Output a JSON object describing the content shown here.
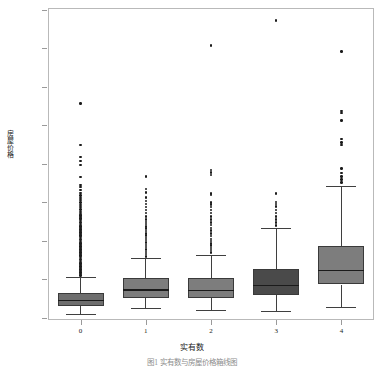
{
  "chart_data": {
    "type": "box",
    "title": "",
    "xlabel": "实有数",
    "ylabel": "房屋价格",
    "caption": "图1 实有数与房屋价格箱线图",
    "categories": [
      "0",
      "1",
      "2",
      "3",
      "4"
    ],
    "ylim": [
      0,
      8000000
    ],
    "ytick_labels": [
      "0",
      "1000000",
      "2000000",
      "3000000",
      "4000000",
      "5000000",
      "6000000",
      "7000000",
      "8000000"
    ],
    "ytick_values": [
      0,
      1000000,
      2000000,
      3000000,
      4000000,
      5000000,
      6000000,
      7000000,
      8000000
    ],
    "grid": false,
    "legend": "none",
    "box_fill_color": "#7f7f7f",
    "box_edge_color": "#3a3a3a",
    "median_color": "#1b1b1b",
    "flier_color": "#1c1c1c",
    "boxes": [
      {
        "category": "0",
        "q1": 300000,
        "median": 450000,
        "q3": 640000,
        "whisker_low": 100000,
        "whisker_high": 1060000,
        "fill": "#6e6e6e",
        "fliers": [
          1100000,
          1140000,
          1180000,
          1220000,
          1260000,
          1300000,
          1340000,
          1380000,
          1420000,
          1460000,
          1500000,
          1540000,
          1580000,
          1620000,
          1660000,
          1700000,
          1740000,
          1780000,
          1820000,
          1860000,
          1900000,
          1940000,
          1980000,
          2020000,
          2060000,
          2100000,
          2140000,
          2180000,
          2220000,
          2260000,
          2300000,
          2340000,
          2380000,
          2420000,
          2460000,
          2500000,
          2540000,
          2580000,
          2620000,
          2660000,
          2700000,
          2760000,
          2820000,
          2880000,
          2940000,
          3000000,
          3060000,
          3120000,
          3180000,
          3250000,
          3320000,
          3400000,
          3450000,
          3660000,
          3980000,
          4080000,
          4180000,
          4500000,
          5570000
        ]
      },
      {
        "category": "1",
        "q1": 510000,
        "median": 720000,
        "q3": 1040000,
        "whisker_low": 250000,
        "whisker_high": 1550000,
        "fill": "#7d7d7d",
        "fliers": [
          1600000,
          1660000,
          1720000,
          1780000,
          1840000,
          1900000,
          1960000,
          2020000,
          2080000,
          2140000,
          2200000,
          2260000,
          2320000,
          2380000,
          2440000,
          2500000,
          2560000,
          2640000,
          2720000,
          2800000,
          2880000,
          2960000,
          3040000,
          3130000,
          3260000,
          3350000,
          3680000
        ]
      },
      {
        "category": "2",
        "q1": 520000,
        "median": 710000,
        "q3": 1030000,
        "whisker_low": 200000,
        "whisker_high": 1630000,
        "fill": "#7d7d7d",
        "fliers": [
          1700000,
          1760000,
          1820000,
          1880000,
          1940000,
          2000000,
          2060000,
          2130000,
          2200000,
          2270000,
          2340000,
          2410000,
          2480000,
          2560000,
          2640000,
          2720000,
          2800000,
          2880000,
          2950000,
          3000000,
          3200000,
          3230000,
          3720000,
          3780000,
          3840000,
          7080000
        ]
      },
      {
        "category": "3",
        "q1": 590000,
        "median": 840000,
        "q3": 1280000,
        "whisker_low": 190000,
        "whisker_high": 2340000,
        "fill": "#4a4a4a",
        "fliers": [
          2400000,
          2480000,
          2560000,
          2640000,
          2720000,
          2800000,
          2900000,
          2960000,
          3010000,
          3230000,
          7730000
        ]
      },
      {
        "category": "4",
        "q1": 870000,
        "median": 1230000,
        "q3": 1880000,
        "whisker_low": 290000,
        "whisker_high": 3420000,
        "fill": "#7d7d7d",
        "fliers": [
          3520000,
          3600000,
          3680000,
          3760000,
          3880000,
          4490000,
          4560000,
          4650000,
          5130000,
          5320000,
          5380000,
          6920000
        ]
      }
    ]
  }
}
